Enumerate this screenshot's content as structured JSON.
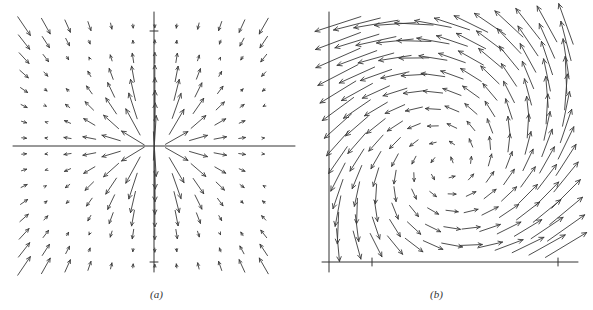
{
  "figure": {
    "panels": [
      {
        "id": "a",
        "caption": "(a)",
        "caption_pos": [
          150,
          298
        ],
        "axes": {
          "origin": [
            154,
            146
          ],
          "x_axis": [
            13,
            295
          ],
          "y_axis": [
            12,
            272
          ],
          "ticks_y": [
            31,
            262
          ],
          "ticks_x": []
        },
        "field": "radial_ring",
        "description": "Direction field with arrows converging onto a circle centered at the origin; arrows outside the ring point inward, arrows inside point outward toward the ring."
      },
      {
        "id": "b",
        "caption": "(b)",
        "caption_pos": [
          430,
          298
        ],
        "axes": {
          "origin": [
            329,
            262
          ],
          "x_axis": [
            322,
            578
          ],
          "y_axis": [
            12,
            272
          ],
          "ticks_x": [
            372,
            558
          ],
          "ticks_y": []
        },
        "field": "rotating_spiral",
        "description": "Direction field in the first quadrant showing counterclockwise circulation around an interior equilibrium (predator-prey style orbits)."
      }
    ],
    "stroke_color": "#3a3a3a",
    "axis_color": "#333333"
  }
}
